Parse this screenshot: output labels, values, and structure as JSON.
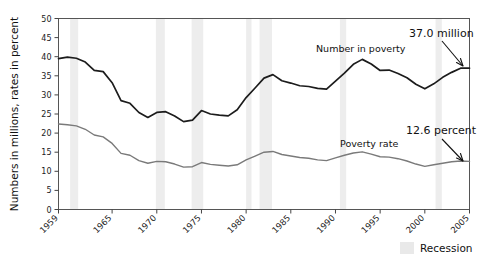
{
  "chart_data": {
    "type": "line",
    "title": "",
    "subtitle": "",
    "xlabel": "",
    "ylabel": "Numbers in millions, rates in percent",
    "xlim": [
      1959,
      2005
    ],
    "ylim": [
      0,
      50
    ],
    "grid": false,
    "legend_position": "bottom-right",
    "x_tick_labels": [
      "1959",
      "1965",
      "1970",
      "1975",
      "1980",
      "1985",
      "1990",
      "1995",
      "2000",
      "2005"
    ],
    "x_tick_values": [
      1959,
      1965,
      1970,
      1975,
      1980,
      1985,
      1990,
      1995,
      2000,
      2005
    ],
    "y_tick_labels": [
      "0",
      "5",
      "10",
      "15",
      "20",
      "25",
      "30",
      "35",
      "40",
      "45",
      "50"
    ],
    "y_tick_values": [
      0,
      5,
      10,
      15,
      20,
      25,
      30,
      35,
      40,
      45,
      50
    ],
    "x": [
      1959,
      1960,
      1961,
      1962,
      1963,
      1964,
      1965,
      1966,
      1967,
      1968,
      1969,
      1970,
      1971,
      1972,
      1973,
      1974,
      1975,
      1976,
      1977,
      1978,
      1979,
      1980,
      1981,
      1982,
      1983,
      1984,
      1985,
      1986,
      1987,
      1988,
      1989,
      1990,
      1991,
      1992,
      1993,
      1994,
      1995,
      1996,
      1997,
      1998,
      1999,
      2000,
      2001,
      2002,
      2003,
      2004,
      2005
    ],
    "series": [
      {
        "name": "Number in poverty",
        "unit": "millions",
        "color": "#1c1c1c",
        "values": [
          39.5,
          39.9,
          39.6,
          38.6,
          36.4,
          36.1,
          33.2,
          28.5,
          27.8,
          25.4,
          24.1,
          25.4,
          25.6,
          24.5,
          23.0,
          23.4,
          25.9,
          25.0,
          24.7,
          24.5,
          26.1,
          29.3,
          31.8,
          34.4,
          35.3,
          33.7,
          33.1,
          32.4,
          32.2,
          31.7,
          31.5,
          33.6,
          35.7,
          38.0,
          39.3,
          38.1,
          36.4,
          36.5,
          35.6,
          34.5,
          32.8,
          31.6,
          32.9,
          34.6,
          35.9,
          37.0,
          37.0
        ],
        "end_annotation": "37.0 million"
      },
      {
        "name": "Poverty rate",
        "unit": "percent",
        "color": "#7a7a7a",
        "values": [
          22.4,
          22.2,
          21.9,
          21.0,
          19.5,
          19.0,
          17.3,
          14.7,
          14.2,
          12.8,
          12.1,
          12.6,
          12.5,
          11.9,
          11.1,
          11.2,
          12.3,
          11.8,
          11.6,
          11.4,
          11.7,
          13.0,
          14.0,
          15.0,
          15.2,
          14.4,
          14.0,
          13.6,
          13.4,
          13.0,
          12.8,
          13.5,
          14.2,
          14.8,
          15.1,
          14.5,
          13.8,
          13.7,
          13.3,
          12.7,
          11.9,
          11.3,
          11.7,
          12.1,
          12.5,
          12.7,
          12.6
        ],
        "end_annotation": "12.6 percent"
      }
    ],
    "recession_bands": [
      {
        "start": 1960.3,
        "end": 1961.2
      },
      {
        "start": 1969.9,
        "end": 1970.9
      },
      {
        "start": 1973.9,
        "end": 1975.2
      },
      {
        "start": 1980.0,
        "end": 1980.6
      },
      {
        "start": 1981.5,
        "end": 1982.9
      },
      {
        "start": 1990.5,
        "end": 1991.2
      },
      {
        "start": 2001.2,
        "end": 2001.9
      }
    ],
    "annotations": [
      {
        "name": "number-in-poverty-label",
        "text": "Number in poverty"
      },
      {
        "name": "poverty-rate-label",
        "text": "Poverty rate"
      },
      {
        "name": "number-endpoint-value",
        "text": "37.0 million"
      },
      {
        "name": "rate-endpoint-value",
        "text": "12.6 percent"
      }
    ],
    "legend": [
      {
        "label": "Recession",
        "color": "#e9e9e9"
      }
    ]
  }
}
